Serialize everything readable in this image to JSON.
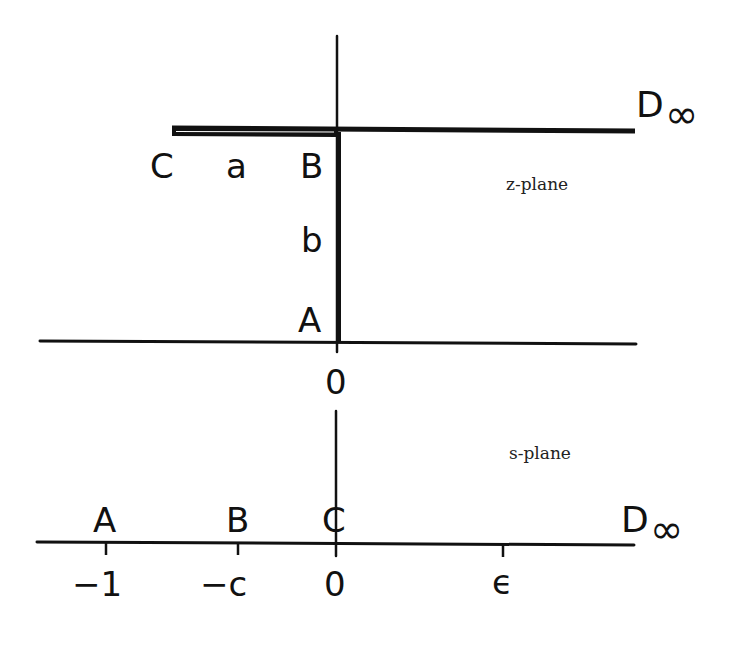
{
  "z_plane": {
    "title": "z-plane",
    "origin_label": "0",
    "points": {
      "A": "A",
      "B": "B",
      "C": "C",
      "D": "D",
      "D_sub": "∞"
    },
    "segment_labels": {
      "CB": "a",
      "BA": "b"
    }
  },
  "s_plane": {
    "title": "s-plane",
    "points": {
      "A": "A",
      "B": "B",
      "C": "C",
      "D": "D",
      "D_sub": "∞"
    },
    "ticks": [
      {
        "label": "−1",
        "point": "A"
      },
      {
        "label": "−c",
        "point": "B"
      },
      {
        "label": "0",
        "point": "C"
      },
      {
        "label": "ϵ",
        "point": ""
      }
    ]
  },
  "colors": {
    "ink": "#111111",
    "background": "#ffffff"
  }
}
